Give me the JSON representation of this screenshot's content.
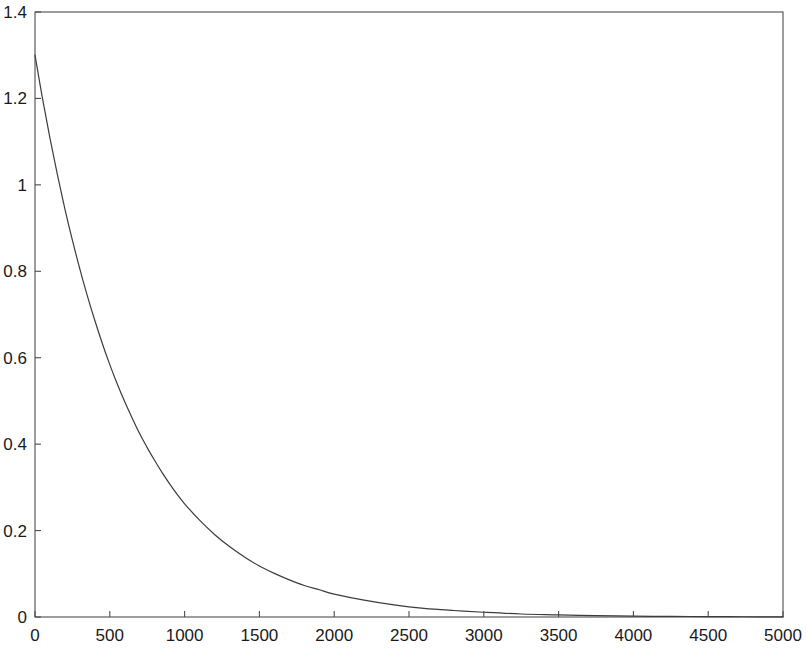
{
  "chart_data": {
    "type": "line",
    "title": "",
    "subtitle": "",
    "xlabel": "",
    "ylabel": "",
    "xlim": [
      0,
      5000
    ],
    "ylim": [
      0,
      1.4
    ],
    "grid": false,
    "legend": null,
    "legend_position": "none",
    "xticks": [
      0,
      500,
      1000,
      1500,
      2000,
      2500,
      3000,
      3500,
      4000,
      4500,
      5000
    ],
    "xtick_labels": [
      "0",
      "500",
      "1000",
      "1500",
      "2000",
      "2500",
      "3000",
      "3500",
      "4000",
      "4500",
      "5000"
    ],
    "yticks": [
      0,
      0.2,
      0.4,
      0.6,
      0.8,
      1,
      1.2,
      1.4
    ],
    "ytick_labels": [
      "0",
      "0.2",
      "0.4",
      "0.6",
      "0.8",
      "1",
      "1.2",
      "1.4"
    ],
    "line_color": "#3c3c3c",
    "line_width": 1.2,
    "axis_color": "#4d4d4d",
    "background_color": "#ffffff",
    "series": [
      {
        "name": "exponential decay",
        "x": [
          0,
          50,
          100,
          150,
          200,
          250,
          300,
          350,
          400,
          450,
          500,
          550,
          600,
          650,
          700,
          750,
          800,
          850,
          900,
          950,
          1000,
          1100,
          1200,
          1300,
          1400,
          1500,
          1600,
          1700,
          1800,
          1900,
          2000,
          2200,
          2400,
          2600,
          2800,
          3000,
          3250,
          3500,
          3750,
          4000,
          4250,
          4500,
          4750,
          5000
        ],
        "values": [
          1.3,
          1.2,
          1.108,
          1.023,
          0.944,
          0.872,
          0.805,
          0.743,
          0.686,
          0.633,
          0.584,
          0.539,
          0.498,
          0.46,
          0.424,
          0.392,
          0.362,
          0.334,
          0.308,
          0.284,
          0.262,
          0.224,
          0.191,
          0.163,
          0.139,
          0.118,
          0.101,
          0.086,
          0.073,
          0.063,
          0.053,
          0.039,
          0.028,
          0.02,
          0.015,
          0.011,
          0.007,
          0.005,
          0.003,
          0.002,
          0.0014,
          0.0009,
          0.0006,
          0.0004
        ]
      }
    ],
    "annotations": []
  },
  "axes": {
    "frame": "full-box",
    "tick_direction": "in",
    "y_start_value": 1.3
  }
}
